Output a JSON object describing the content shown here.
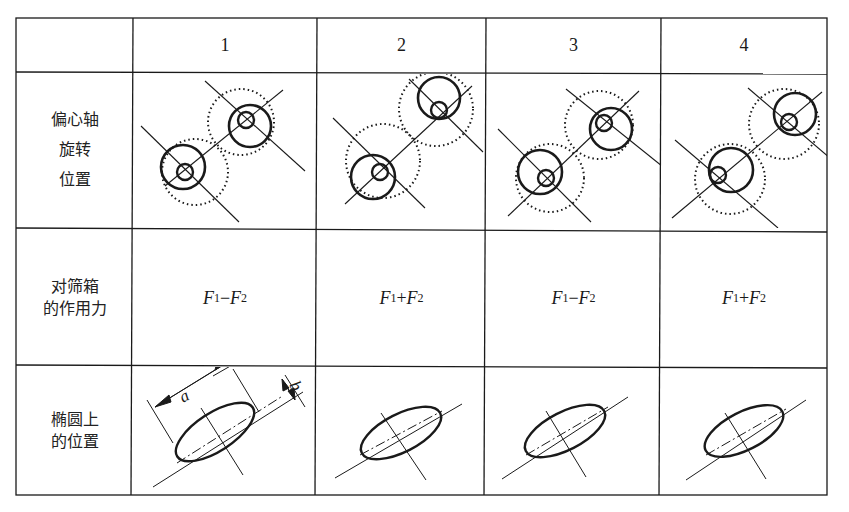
{
  "table": {
    "header": {
      "corner": "",
      "columns": [
        "1",
        "2",
        "3",
        "4"
      ]
    },
    "rows": [
      {
        "label_lines": [
          "偏心轴",
          "旋转",
          "位置"
        ],
        "type": "eccentric-shaft-diagram"
      },
      {
        "label_lines": [
          "对筛箱",
          "的作用力"
        ],
        "type": "force",
        "values": [
          {
            "a": "F",
            "a_sub": "1",
            "op": "−",
            "b": "F",
            "b_sub": "2"
          },
          {
            "a": "F",
            "a_sub": "1",
            "op": "+",
            "b": "F",
            "b_sub": "2"
          },
          {
            "a": "F",
            "a_sub": "1",
            "op": "−",
            "b": "F",
            "b_sub": "2"
          },
          {
            "a": "F",
            "a_sub": "1",
            "op": "+",
            "b": "F",
            "b_sub": "2"
          }
        ]
      },
      {
        "label_lines": [
          "椭圆上",
          "的位置"
        ],
        "type": "ellipse-diagram",
        "dimension_labels": {
          "major": "a",
          "minor": "b"
        }
      }
    ]
  },
  "colors": {
    "line": "#1a1a1a",
    "background": "#ffffff"
  }
}
